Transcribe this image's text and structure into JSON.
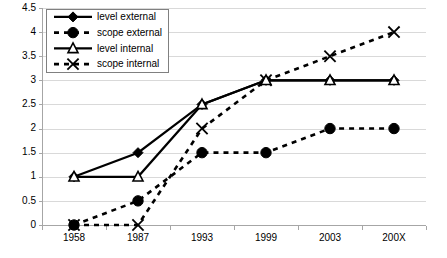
{
  "chart_data": {
    "type": "line",
    "title": "",
    "xlabel": "",
    "ylabel": "",
    "categories": [
      "1958",
      "1987",
      "1993",
      "1999",
      "2003",
      "200X"
    ],
    "ylim": [
      0,
      4.5
    ],
    "ytick_step": 0.5,
    "yticks": [
      "0",
      "0.5",
      "1",
      "1.5",
      "2",
      "2.5",
      "3",
      "3.5",
      "4",
      "4.5"
    ],
    "grid": true,
    "legend_position": "top-left",
    "series": [
      {
        "name": "level external",
        "values": [
          1,
          1.5,
          2.5,
          3,
          3,
          3
        ],
        "line_style": "solid",
        "marker": "diamond-filled",
        "color": "#000000"
      },
      {
        "name": "scope external",
        "values": [
          0,
          0.5,
          1.5,
          1.5,
          2,
          2
        ],
        "line_style": "dashed",
        "marker": "circle-filled",
        "color": "#000000"
      },
      {
        "name": "level internal",
        "values": [
          1,
          1,
          2.5,
          3,
          3,
          3
        ],
        "line_style": "solid",
        "marker": "triangle-open",
        "color": "#000000"
      },
      {
        "name": "scope internal",
        "values": [
          0,
          0,
          2,
          3,
          3.5,
          4
        ],
        "line_style": "dashed",
        "marker": "x",
        "color": "#000000"
      }
    ]
  },
  "legend": {
    "entries": [
      {
        "label": "level external"
      },
      {
        "label": "scope external"
      },
      {
        "label": "level internal"
      },
      {
        "label": "scope internal"
      }
    ]
  }
}
